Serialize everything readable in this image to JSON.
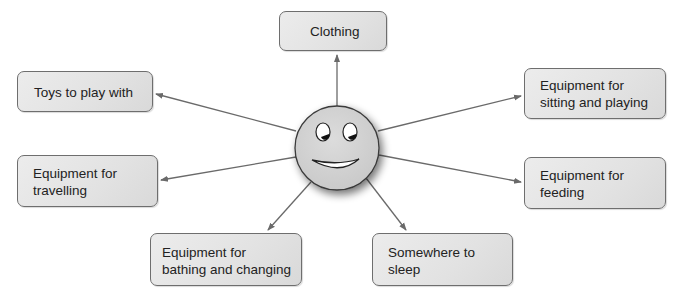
{
  "diagram": {
    "type": "mind-map",
    "center": {
      "label": "smiley-face",
      "cx": 337,
      "cy": 148,
      "r": 42
    },
    "colors": {
      "box_fill": "#e4e4e4",
      "box_border": "#6e6e6e",
      "arrow": "#6a6a6a",
      "face_fill": "#d4d4d4",
      "text": "#222222"
    },
    "nodes": [
      {
        "id": "clothing",
        "label": "Clothing"
      },
      {
        "id": "toys",
        "label": "Toys to play with"
      },
      {
        "id": "sitting",
        "line1": "Equipment for",
        "line2": "sitting and playing"
      },
      {
        "id": "travelling",
        "line1": "Equipment for",
        "line2": "travelling"
      },
      {
        "id": "feeding",
        "line1": "Equipment for",
        "line2": "feeding"
      },
      {
        "id": "bathing",
        "line1": "Equipment for",
        "line2": "bathing and changing"
      },
      {
        "id": "sleep",
        "line1": "Somewhere to",
        "line2": "sleep"
      }
    ]
  }
}
